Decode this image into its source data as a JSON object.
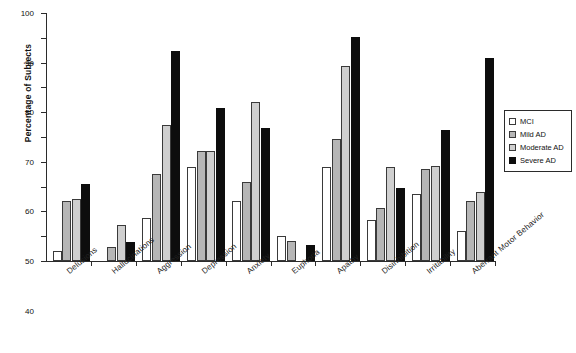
{
  "chart_data": {
    "type": "bar",
    "title": "",
    "xlabel": "",
    "ylabel": "Percentage of Subjects",
    "ylim": [
      0,
      100
    ],
    "ytick_step": 10,
    "yticks": [
      0,
      10,
      20,
      30,
      40,
      50,
      60,
      70,
      80,
      90,
      100
    ],
    "grid": false,
    "legend_position": "right",
    "categories": [
      "Delusions",
      "Hallucinations",
      "Aggression",
      "Depression",
      "Anxiety",
      "Euphoria",
      "Apathy",
      "Disinhibition",
      "Irritability",
      "Aberrant Motor Behavior"
    ],
    "series": [
      {
        "name": "MCI",
        "color": "#ffffff",
        "values": [
          4,
          0,
          17.5,
          38,
          24,
          10,
          38,
          16.5,
          27,
          12
        ]
      },
      {
        "name": "Mild AD",
        "color": "#b6b6b6",
        "values": [
          24,
          5.5,
          35,
          44.5,
          32,
          8,
          49,
          21.5,
          37,
          24
        ]
      },
      {
        "name": "Moderate AD",
        "color": "#cfcfcf",
        "values": [
          25,
          14.5,
          55,
          44.5,
          64,
          0,
          78.5,
          38,
          38.5,
          28
        ]
      },
      {
        "name": "Severe AD",
        "color": "#0d0d0d",
        "values": [
          31,
          7.5,
          84.5,
          61.5,
          53.5,
          6.5,
          90.5,
          29.5,
          53,
          82
        ]
      }
    ]
  },
  "legend": {
    "items": [
      "MCI",
      "Mild AD",
      "Moderate AD",
      "Severe AD"
    ]
  },
  "footer": {
    "note": ""
  }
}
